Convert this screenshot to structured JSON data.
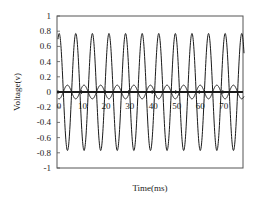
{
  "chart_data": {
    "type": "line",
    "title": "",
    "xlabel": "Time(ms)",
    "ylabel": "Voltage(v)",
    "xlim": [
      0,
      79
    ],
    "ylim": [
      -1,
      1
    ],
    "grid": false,
    "legend": null,
    "x_tick_labels": [
      "0",
      "10",
      "20",
      "30",
      "40",
      "50",
      "60",
      "70"
    ],
    "x_ticks": [
      0,
      10,
      20,
      30,
      40,
      50,
      60,
      70
    ],
    "y_tick_labels": [
      "1",
      "0.8",
      "0.6",
      "0.4",
      "0.2",
      "0",
      "-0.2",
      "-0.4",
      "-0.6",
      "-0.8",
      "-1"
    ],
    "y_ticks": [
      1,
      0.8,
      0.6,
      0.4,
      0.2,
      0,
      -0.2,
      -0.4,
      -0.6,
      -0.8,
      -1
    ],
    "series": [
      {
        "name": "large sinusoid",
        "kind": "sine",
        "amplitude": 0.77,
        "period_ms": 7.05,
        "phase_peak_ms": 0.5,
        "offset": 0,
        "stroke_width": 1
      },
      {
        "name": "small sinusoid",
        "kind": "sine",
        "amplitude": 0.09,
        "period_ms": 7.05,
        "phase_peak_ms": 4.0,
        "offset": 0,
        "stroke_width": 1
      },
      {
        "name": "zero line",
        "kind": "constant",
        "value": 0,
        "stroke_width": 1.8
      }
    ]
  },
  "colors": {
    "line": "#1a1a1a",
    "frame": "#555555",
    "background": "#ffffff"
  }
}
